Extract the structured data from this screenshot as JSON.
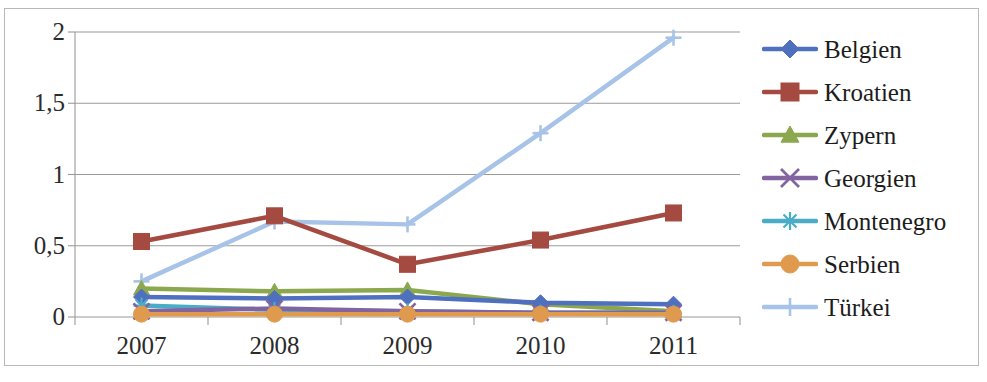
{
  "chart_data": {
    "type": "line",
    "title": "",
    "xlabel": "",
    "ylabel": "",
    "categories": [
      "2007",
      "2008",
      "2009",
      "2010",
      "2011"
    ],
    "x_tick_labels": [
      "2007",
      "2008",
      "2009",
      "2010",
      "2011"
    ],
    "y_tick_labels": [
      "0",
      "0,5",
      "1",
      "1,5",
      "2"
    ],
    "y_tick_values": [
      0,
      0.5,
      1,
      1.5,
      2
    ],
    "ylim": [
      0,
      2
    ],
    "grid": "horizontal",
    "legend_position": "right",
    "series": [
      {
        "name": "Belgien",
        "color": "#4F6FBF",
        "marker": "diamond",
        "values": [
          0.14,
          0.13,
          0.14,
          0.1,
          0.09
        ]
      },
      {
        "name": "Kroatien",
        "color": "#A54A41",
        "marker": "square",
        "values": [
          0.53,
          0.71,
          0.37,
          0.54,
          0.73
        ]
      },
      {
        "name": "Zypern",
        "color": "#8CA84E",
        "marker": "triangle",
        "values": [
          0.2,
          0.18,
          0.19,
          0.09,
          0.04
        ]
      },
      {
        "name": "Georgien",
        "color": "#8264A0",
        "marker": "cross-x",
        "values": [
          0.04,
          0.06,
          0.04,
          0.03,
          0.03
        ]
      },
      {
        "name": "Montenegro",
        "color": "#4BACC6",
        "marker": "asterisk",
        "values": [
          0.08,
          0.05,
          0.04,
          0.03,
          0.03
        ]
      },
      {
        "name": "Serbien",
        "color": "#E09A4E",
        "marker": "circle",
        "values": [
          0.02,
          0.02,
          0.02,
          0.02,
          0.02
        ]
      },
      {
        "name": "Türkei",
        "color": "#A8C3E8",
        "marker": "plus",
        "values": [
          0.25,
          0.67,
          0.65,
          1.29,
          1.96
        ]
      }
    ]
  },
  "legend": {
    "items": [
      {
        "label": "Belgien"
      },
      {
        "label": "Kroatien"
      },
      {
        "label": "Zypern"
      },
      {
        "label": "Georgien"
      },
      {
        "label": "Montenegro"
      },
      {
        "label": "Serbien"
      },
      {
        "label": "Türkei"
      }
    ]
  },
  "axes": {
    "y_labels": [
      "2",
      "1,5",
      "1",
      "0,5",
      "0"
    ],
    "x_labels": [
      "2007",
      "2008",
      "2009",
      "2010",
      "2011"
    ]
  },
  "colors": {
    "grid": "#9a9a9a",
    "frame": "#b9b9b9",
    "text": "#1c1c1c"
  }
}
